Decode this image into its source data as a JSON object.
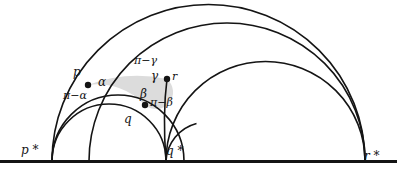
{
  "figure": {
    "background_color": "#ffffff",
    "stroke_color": "#141414",
    "shade_color": "#d9d9d9",
    "baseline_y": 161,
    "ideal_points": [
      {
        "id": "p-star",
        "label": "p *",
        "x": 52
      },
      {
        "id": "q-star",
        "label": "q *",
        "x": 166
      },
      {
        "id": "r-star",
        "label": "r *",
        "x": 365
      }
    ],
    "vertices": [
      {
        "id": "p",
        "label": "p",
        "x": 88,
        "y": 85
      },
      {
        "id": "q",
        "label": "q",
        "x": 145,
        "y": 105
      },
      {
        "id": "r",
        "label": "r",
        "x": 167,
        "y": 79
      }
    ],
    "interior_angles": [
      {
        "id": "alpha",
        "label": "α",
        "x": 101,
        "y": 79
      },
      {
        "id": "beta",
        "label": "β",
        "x": 144,
        "y": 92
      },
      {
        "id": "gamma",
        "label": "γ",
        "x": 154,
        "y": 73
      }
    ],
    "exterior_angles": [
      {
        "id": "pi-minus-alpha",
        "label": "π−α",
        "x": 71,
        "y": 92
      },
      {
        "id": "pi-minus-beta",
        "label": "π−β",
        "x": 150,
        "y": 98
      },
      {
        "id": "pi-minus-gamma",
        "label": "π−γ",
        "x": 141,
        "y": 58
      }
    ],
    "vertex_labels": [
      {
        "id": "p-label",
        "label": "p",
        "x": 75,
        "y": 70
      },
      {
        "id": "q-label",
        "label": "q",
        "x": 125,
        "y": 118
      },
      {
        "id": "r-label",
        "label": "r",
        "x": 172,
        "y": 73
      }
    ],
    "ideal_point_labels": [
      {
        "id": "p-star-label",
        "label": "p *",
        "x": 21,
        "y": 145
      },
      {
        "id": "q-star-label",
        "label": "q *",
        "x": 166,
        "y": 146
      },
      {
        "id": "r-star-label",
        "label": "r *",
        "x": 364,
        "y": 152
      }
    ],
    "geodesics": [
      {
        "id": "geodesic-p-star-r-star-outer",
        "from": "p-star",
        "to": "r-star",
        "cx": 208.5,
        "r": 156.5
      },
      {
        "id": "geodesic-p-r",
        "from": "p-star",
        "to": "r-star",
        "cx": 227.0,
        "r": 138.0
      },
      {
        "id": "geodesic-q-star-r-star",
        "from": "q-star",
        "to": "r-star",
        "cx": 265.5,
        "r": 99.5
      },
      {
        "id": "geodesic-p-q",
        "from": "p-star",
        "to": "q-star",
        "cx": 118.0,
        "r": 66.0
      },
      {
        "id": "geodesic-p-star-q-star-inner",
        "from": "p-star",
        "to": "q-star",
        "cx": 109.0,
        "r": 57.0
      },
      {
        "id": "geodesic-q-r",
        "from": "q-star",
        "to": "r-star",
        "cx": 181.0,
        "r": 15.0
      }
    ],
    "baseline": {
      "id": "real-axis",
      "x1": 0,
      "x2": 397,
      "y": 161
    }
  }
}
